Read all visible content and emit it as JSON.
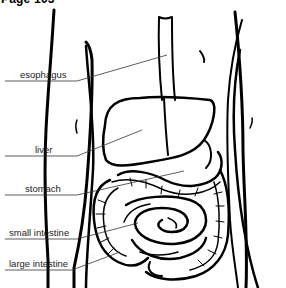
{
  "header": {
    "title": "Page 105"
  },
  "diagram": {
    "labels": [
      {
        "text": "esophagus",
        "x": 20,
        "y": 67,
        "line_start": [
          5,
          81
        ],
        "line_end": [
          167,
          55
        ]
      },
      {
        "text": "liver",
        "x": 35,
        "y": 142,
        "line_start": [
          5,
          156
        ],
        "line_end": [
          142,
          130
        ]
      },
      {
        "text": "stomach",
        "x": 25,
        "y": 181,
        "line_start": [
          5,
          195
        ],
        "line_end": [
          184,
          171
        ]
      },
      {
        "text": "small intestine",
        "x": 9,
        "y": 226,
        "line_start": [
          5,
          239
        ],
        "line_end": [
          138,
          223
        ]
      },
      {
        "text": "large intestine",
        "x": 9,
        "y": 257,
        "line_start": [
          5,
          270
        ],
        "line_end": [
          120,
          252
        ]
      }
    ]
  },
  "colors": {
    "background": "#ffffff",
    "line": "#000000",
    "leader": "#333333",
    "text": "#222222"
  }
}
